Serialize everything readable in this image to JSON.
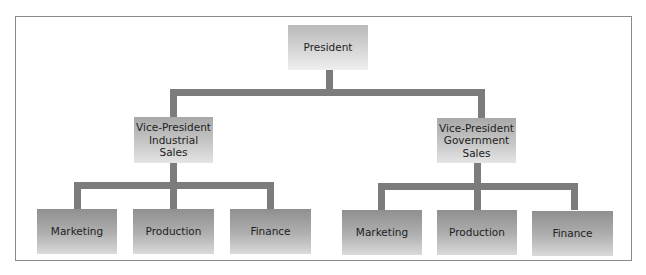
{
  "org_chart": {
    "root": {
      "label": "President"
    },
    "divisions": [
      {
        "label": "Vice-President\nIndustrial\nSales",
        "children": [
          {
            "label": "Marketing"
          },
          {
            "label": "Production"
          },
          {
            "label": "Finance"
          }
        ]
      },
      {
        "label": "Vice-President\nGovernment\nSales",
        "children": [
          {
            "label": "Marketing"
          },
          {
            "label": "Production"
          },
          {
            "label": "Finance"
          }
        ]
      }
    ]
  },
  "colors": {
    "connector": "#7c7c7c",
    "frame_border": "#8a8a8a",
    "text": "#222222"
  }
}
